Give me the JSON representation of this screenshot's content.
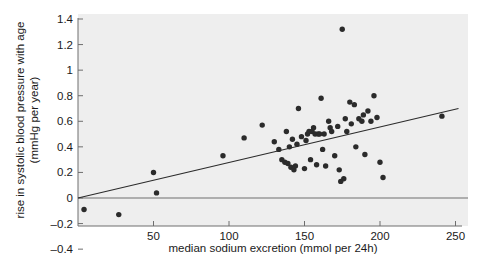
{
  "chart_data": {
    "type": "scatter",
    "title": "",
    "xlabel": "median sodium excretion (mmol per 24h)",
    "ylabel": "rise in systolic blood pressure with age (mmHg per year)",
    "xlim": [
      0,
      260
    ],
    "ylim": [
      -0.4,
      1.4
    ],
    "xticks": [
      50,
      100,
      150,
      200,
      250
    ],
    "xtick_labels": [
      "50",
      "100",
      "150",
      "200",
      "250"
    ],
    "yticks": [
      -0.4,
      -0.2,
      0,
      0.2,
      0.4,
      0.6,
      0.8,
      1,
      1.2,
      1.4
    ],
    "ytick_labels": [
      "-0.4",
      "-0.2",
      "0",
      "0.2",
      "0.4",
      "0.6",
      "0.8",
      "1",
      "1.2",
      "1.4"
    ],
    "grid": false,
    "legend": null,
    "marker_color": "#2b2b2b",
    "line_color": "#2b2b2b",
    "plot_background": "#eeeeee",
    "series": [
      {
        "name": "centres",
        "marker": "circle",
        "points": [
          [
            4,
            -0.09
          ],
          [
            27,
            -0.13
          ],
          [
            50,
            0.2
          ],
          [
            52,
            0.04
          ],
          [
            96,
            0.33
          ],
          [
            110,
            0.47
          ],
          [
            122,
            0.57
          ],
          [
            130,
            0.44
          ],
          [
            133,
            0.38
          ],
          [
            135,
            0.3
          ],
          [
            137,
            0.28
          ],
          [
            138,
            0.52
          ],
          [
            139,
            0.27
          ],
          [
            140,
            0.4
          ],
          [
            141,
            0.24
          ],
          [
            142,
            0.46
          ],
          [
            143,
            0.22
          ],
          [
            144,
            0.25
          ],
          [
            145,
            0.42
          ],
          [
            146,
            0.7
          ],
          [
            148,
            0.48
          ],
          [
            150,
            0.23
          ],
          [
            151,
            0.45
          ],
          [
            152,
            0.5
          ],
          [
            153,
            0.52
          ],
          [
            154,
            0.3
          ],
          [
            155,
            0.52
          ],
          [
            156,
            0.55
          ],
          [
            157,
            0.5
          ],
          [
            158,
            0.26
          ],
          [
            159,
            0.5
          ],
          [
            160,
            0.5
          ],
          [
            161,
            0.78
          ],
          [
            162,
            0.38
          ],
          [
            163,
            0.5
          ],
          [
            164,
            0.25
          ],
          [
            166,
            0.6
          ],
          [
            167,
            0.55
          ],
          [
            168,
            0.52
          ],
          [
            170,
            0.33
          ],
          [
            172,
            0.56
          ],
          [
            173,
            0.22
          ],
          [
            174,
            0.13
          ],
          [
            175,
            1.32
          ],
          [
            176,
            0.15
          ],
          [
            177,
            0.62
          ],
          [
            178,
            0.52
          ],
          [
            180,
            0.75
          ],
          [
            181,
            0.58
          ],
          [
            183,
            0.73
          ],
          [
            184,
            0.4
          ],
          [
            186,
            0.62
          ],
          [
            188,
            0.6
          ],
          [
            189,
            0.65
          ],
          [
            190,
            0.34
          ],
          [
            192,
            0.68
          ],
          [
            194,
            0.6
          ],
          [
            196,
            0.8
          ],
          [
            198,
            0.63
          ],
          [
            200,
            0.28
          ],
          [
            202,
            0.16
          ],
          [
            241,
            0.64
          ]
        ]
      }
    ],
    "fit_line": {
      "name": "regression line",
      "x_start": 0,
      "y_start": 0.0,
      "x_end": 252,
      "y_end": 0.7
    }
  }
}
